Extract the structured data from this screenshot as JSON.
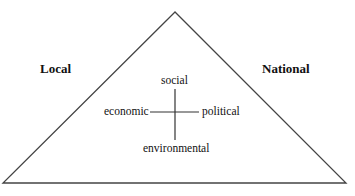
{
  "diagram": {
    "type": "triangle-with-cross",
    "corner_labels": {
      "left": "Local",
      "right": "National"
    },
    "cross_labels": {
      "top": "social",
      "left": "economic",
      "right": "political",
      "bottom": "environmental"
    },
    "colors": {
      "line": "#444444",
      "text": "#111111",
      "background": "#ffffff"
    }
  }
}
